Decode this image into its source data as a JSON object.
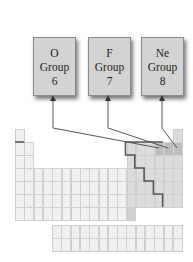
{
  "figure": {
    "type": "periodic-table-group-diagram",
    "boxes": [
      {
        "element": "O",
        "group_label": "Group",
        "group_number": "6",
        "target_column": 16
      },
      {
        "element": "F",
        "group_label": "Group",
        "group_number": "7",
        "target_column": 17
      },
      {
        "element": "Ne",
        "group_label": "Group",
        "group_number": "8",
        "target_column": 18
      }
    ],
    "colors": {
      "box_fill": "#d3d3d3",
      "box_border": "#8a8a8a",
      "arrow": "#555555",
      "cell_fill": "#f0f0f0",
      "cell_border": "#cfcfcf",
      "p_block_fill": "#dcdcdc",
      "highlight_fill": "#bdbdbd",
      "staircase_line": "#555555"
    }
  }
}
